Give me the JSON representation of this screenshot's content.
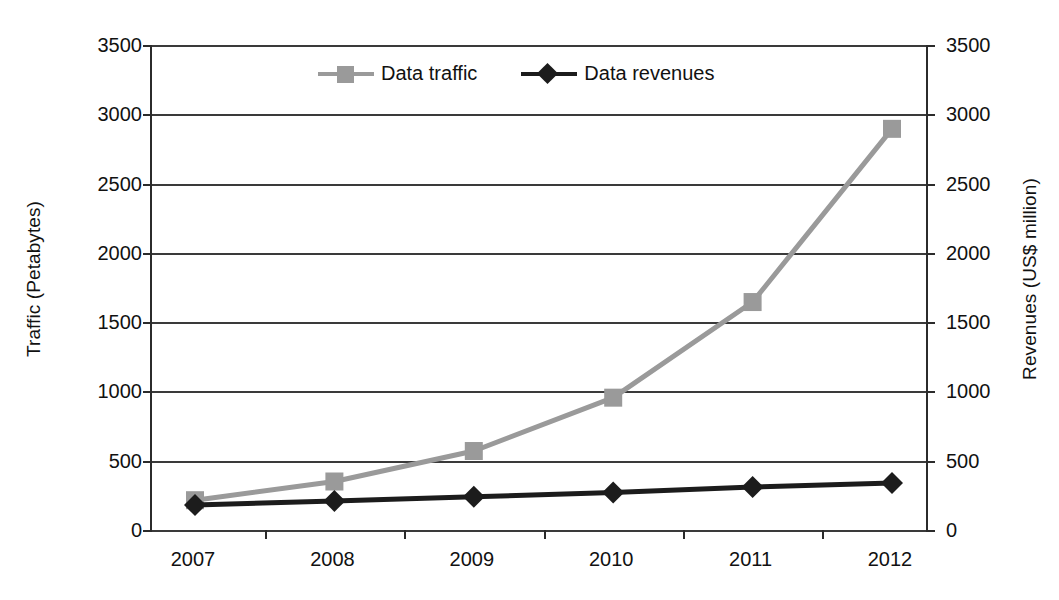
{
  "chart_data": {
    "type": "line",
    "title": "",
    "xlabel": "",
    "categories": [
      "2007",
      "2008",
      "2009",
      "2010",
      "2011",
      "2012"
    ],
    "series": [
      {
        "name": "Data traffic",
        "axis": "left",
        "unit": "Petabytes",
        "color": "#9a9a9a",
        "marker": "square",
        "values": [
          215,
          350,
          570,
          955,
          1645,
          2895
        ]
      },
      {
        "name": "Data revenues",
        "axis": "right",
        "unit": "US$ million",
        "color": "#1c1c1c",
        "marker": "diamond",
        "values": [
          180,
          210,
          240,
          270,
          310,
          340
        ]
      }
    ],
    "left_axis": {
      "label": "Traffic (Petabytes)",
      "ticks": [
        "3500",
        "3000",
        "2500",
        "2000",
        "1500",
        "1000",
        "500",
        "0"
      ],
      "min": 0,
      "max": 3500,
      "step": 500
    },
    "right_axis": {
      "label": "Revenues (US$ million)",
      "ticks": [
        "3500",
        "3000",
        "2500",
        "2000",
        "1500",
        "1000",
        "500",
        "0"
      ],
      "min": 0,
      "max": 3500,
      "step": 500
    },
    "legend": {
      "position": "top-center",
      "entries": [
        {
          "label": "Data traffic",
          "color": "#9a9a9a",
          "marker": "square"
        },
        {
          "label": "Data revenues",
          "color": "#1c1c1c",
          "marker": "diamond"
        }
      ]
    },
    "grid": true
  }
}
